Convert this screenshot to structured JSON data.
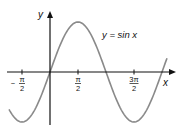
{
  "chart_data": {
    "type": "line",
    "title": "",
    "series": [
      {
        "name": "y = sin x",
        "function": "sin",
        "x_range": [
          -2.2,
          5.5
        ],
        "color": "#8a8a8a"
      }
    ],
    "xlabel": "x",
    "ylabel": "y",
    "x_ticks": [
      {
        "value": -1.5708,
        "num": "π",
        "den": "2",
        "sign": "−"
      },
      {
        "value": 1.5708,
        "num": "π",
        "den": "2",
        "sign": ""
      },
      {
        "value": 4.7124,
        "num": "3π",
        "den": "2",
        "sign": ""
      }
    ],
    "annotation": "y = sin x",
    "ylim": [
      -1.1,
      1.1
    ],
    "grid": false,
    "legend": "none"
  },
  "header_fragment": "Figure"
}
